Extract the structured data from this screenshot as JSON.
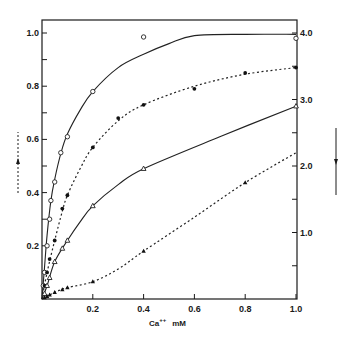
{
  "chart_data": {
    "type": "line",
    "title": "",
    "xlabel": "Ca++ mM",
    "xlabel_base": "Ca",
    "xlabel_sup": "++",
    "xlabel_unit": "mM",
    "ylabel_left": "",
    "ylabel_right": "",
    "xlim": [
      0,
      1.05
    ],
    "ylim_left": [
      0,
      1.05
    ],
    "ylim_right": [
      0,
      4.2
    ],
    "grid": false,
    "legend": "none (arrows indicate axis: dashed up-arrow left, solid down-arrow right)",
    "x_ticks": [
      0.2,
      0.4,
      0.6,
      0.8,
      1.0
    ],
    "x_tick_labels": [
      "0.2",
      "0.4",
      "0.6",
      "0.8",
      "1.0"
    ],
    "y_left_ticks": [
      0.1,
      0.2,
      0.3,
      0.4,
      0.5,
      0.6,
      0.7,
      0.8,
      0.9,
      1.0
    ],
    "y_left_tick_labels": [
      "0.2",
      "0.4",
      "0.6",
      "0.8",
      "1.0"
    ],
    "y_left_labeled_ticks": [
      0.2,
      0.4,
      0.6,
      0.8,
      1.0
    ],
    "y_right_ticks": [
      0.5,
      1.0,
      1.5,
      2.0,
      2.5,
      3.0,
      3.5,
      4.0
    ],
    "y_right_tick_labels": [
      "1.0",
      "2.0",
      "3.0",
      "4.0"
    ],
    "y_right_labeled_ticks": [
      1.0,
      2.0,
      3.0,
      4.0
    ],
    "left_arrow": {
      "direction": "up",
      "style": "dashed"
    },
    "right_arrow": {
      "direction": "down",
      "style": "solid"
    },
    "series": [
      {
        "name": "open circles (solid line)",
        "marker": "open-circle",
        "line": "solid",
        "axis": "left",
        "x": [
          0.005,
          0.01,
          0.02,
          0.03,
          0.035,
          0.05,
          0.074,
          0.1,
          0.2,
          0.4,
          1.0
        ],
        "values": [
          0.05,
          0.1,
          0.2,
          0.3,
          0.37,
          0.44,
          0.55,
          0.61,
          0.78,
          0.985,
          0.98
        ],
        "curve": [
          [
            0,
            0
          ],
          [
            0.01,
            0.12
          ],
          [
            0.02,
            0.24
          ],
          [
            0.035,
            0.37
          ],
          [
            0.05,
            0.45
          ],
          [
            0.075,
            0.55
          ],
          [
            0.1,
            0.62
          ],
          [
            0.15,
            0.71
          ],
          [
            0.2,
            0.78
          ],
          [
            0.3,
            0.87
          ],
          [
            0.4,
            0.92
          ],
          [
            0.5,
            0.96
          ],
          [
            0.6,
            0.99
          ],
          [
            0.8,
            0.995
          ],
          [
            1.0,
            0.995
          ]
        ]
      },
      {
        "name": "filled circles (dashed line)",
        "marker": "filled-circle",
        "line": "dashed",
        "axis": "left",
        "x": [
          0.01,
          0.02,
          0.03,
          0.05,
          0.08,
          0.1,
          0.2,
          0.3,
          0.4,
          0.6,
          0.8,
          1.0
        ],
        "values": [
          0.05,
          0.1,
          0.15,
          0.22,
          0.34,
          0.39,
          0.57,
          0.68,
          0.73,
          0.79,
          0.85,
          0.87
        ],
        "curve": [
          [
            0,
            0
          ],
          [
            0.02,
            0.1
          ],
          [
            0.05,
            0.22
          ],
          [
            0.08,
            0.33
          ],
          [
            0.1,
            0.39
          ],
          [
            0.15,
            0.49
          ],
          [
            0.2,
            0.57
          ],
          [
            0.3,
            0.67
          ],
          [
            0.4,
            0.73
          ],
          [
            0.6,
            0.8
          ],
          [
            0.8,
            0.845
          ],
          [
            1.0,
            0.87
          ]
        ]
      },
      {
        "name": "open triangles (solid line)",
        "marker": "open-triangle",
        "line": "solid",
        "axis": "left",
        "x": [
          0.01,
          0.02,
          0.03,
          0.05,
          0.08,
          0.1,
          0.2,
          0.4,
          1.0
        ],
        "values": [
          0.02,
          0.05,
          0.08,
          0.14,
          0.19,
          0.22,
          0.35,
          0.49,
          0.725
        ],
        "curve": [
          [
            0,
            0
          ],
          [
            0.02,
            0.05
          ],
          [
            0.05,
            0.14
          ],
          [
            0.1,
            0.22
          ],
          [
            0.15,
            0.29
          ],
          [
            0.2,
            0.35
          ],
          [
            0.3,
            0.43
          ],
          [
            0.4,
            0.49
          ],
          [
            0.7,
            0.61
          ],
          [
            1.0,
            0.725
          ]
        ]
      },
      {
        "name": "filled triangles (dashed line)",
        "marker": "filled-triangle",
        "line": "dashed",
        "axis": "right",
        "x": [
          0.01,
          0.02,
          0.03,
          0.05,
          0.08,
          0.1,
          0.2,
          0.4,
          0.8
        ],
        "values": [
          0.02,
          0.04,
          0.06,
          0.1,
          0.14,
          0.17,
          0.26,
          0.72,
          1.75
        ],
        "curve": [
          [
            0,
            0
          ],
          [
            0.05,
            0.1
          ],
          [
            0.1,
            0.17
          ],
          [
            0.2,
            0.26
          ],
          [
            0.3,
            0.45
          ],
          [
            0.4,
            0.72
          ],
          [
            0.6,
            1.23
          ],
          [
            0.8,
            1.75
          ],
          [
            1.0,
            2.2
          ]
        ]
      }
    ]
  }
}
